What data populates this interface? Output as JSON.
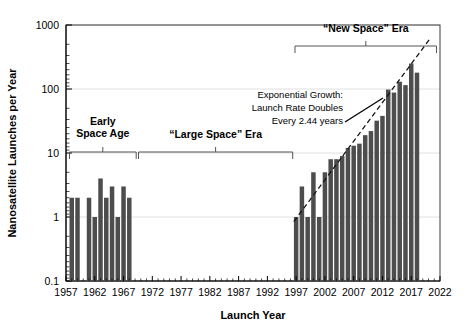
{
  "chart_data": {
    "type": "bar",
    "title": "",
    "xlabel": "Launch Year",
    "ylabel": "Nanosatellite Launches per Year",
    "xlim": [
      1957,
      2022
    ],
    "ylim": [
      0.1,
      1000
    ],
    "yscale": "log",
    "grid": true,
    "legend": null,
    "xticks": [
      1957,
      1962,
      1967,
      1972,
      1977,
      1982,
      1987,
      1992,
      1997,
      2002,
      2007,
      2012,
      2017,
      2022
    ],
    "yticks": [
      0.1,
      1,
      10,
      100,
      1000
    ],
    "ytick_labels": [
      "0.1",
      "1",
      "10",
      "100",
      "1000"
    ],
    "xtick_labels": [
      "1957",
      "1962",
      "1967",
      "1972",
      "1977",
      "1982",
      "1987",
      "1992",
      "1997",
      "2002",
      "2007",
      "2012",
      "2017",
      "2022"
    ],
    "x": [
      1958,
      1959,
      1961,
      1962,
      1963,
      1964,
      1965,
      1966,
      1967,
      1968,
      1997,
      1998,
      1999,
      2000,
      2001,
      2002,
      2003,
      2004,
      2005,
      2006,
      2007,
      2008,
      2009,
      2010,
      2011,
      2012,
      2013,
      2014,
      2015,
      2016,
      2017,
      2018
    ],
    "values": [
      2,
      2,
      2,
      1,
      4,
      2,
      3,
      1,
      3,
      2,
      1,
      3,
      1,
      5,
      1,
      5,
      8,
      8,
      9,
      12,
      13,
      14,
      19,
      22,
      32,
      38,
      98,
      88,
      130,
      115,
      250,
      180
    ],
    "annotations": [
      {
        "name": "exponential-growth-note",
        "lines": [
          "Exponential Growth:",
          "Launch Rate Doubles",
          "Every 2.44 years"
        ]
      }
    ],
    "eras": [
      {
        "name": "early-space-age",
        "lines": [
          "Early",
          "Space Age"
        ],
        "start": 1957.6,
        "end": 1969.2
      },
      {
        "name": "large-space-era",
        "lines": [
          "“Large Space” Era"
        ],
        "start": 1969.6,
        "end": 1996.4
      },
      {
        "name": "new-space-era",
        "lines": [
          "“New Space” Era"
        ],
        "start": 1996.8,
        "end": 2021.4
      }
    ],
    "trendline": {
      "name": "exponential-trend",
      "doubling_time_years": 2.44,
      "x_start": 1996.6,
      "y_start": 0.85,
      "x_end": 2020.2,
      "y_end": 600
    },
    "colors": {
      "bar": "#4d4d4d",
      "grid": "#d8d8d8",
      "axis": "#000000",
      "trend": "#111111",
      "background": "#ffffff"
    }
  }
}
